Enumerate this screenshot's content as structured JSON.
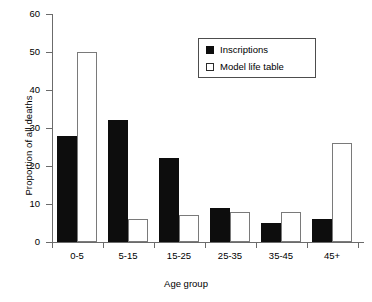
{
  "chart_data": {
    "type": "bar",
    "title": "",
    "xlabel": "Age group",
    "ylabel": "Proportion of all deaths",
    "categories": [
      "0-5",
      "5-15",
      "15-25",
      "25-35",
      "35-45",
      "45+"
    ],
    "series": [
      {
        "name": "Inscriptions",
        "values": [
          28,
          32,
          22,
          9,
          5,
          6
        ],
        "fill": "#0d0d0d",
        "style": "filled"
      },
      {
        "name": "Model life table",
        "values": [
          50,
          6,
          7,
          8,
          8,
          26
        ],
        "fill": "#ffffff",
        "style": "open"
      }
    ],
    "ylim": [
      0,
      60
    ],
    "yticks": [
      0,
      10,
      20,
      30,
      40,
      50,
      60
    ],
    "ytick_labels": [
      "0",
      "10",
      "20",
      "30",
      "40",
      "50",
      "60"
    ],
    "grid": false,
    "legend_position": "top-center-right",
    "legend_entries": [
      "Inscriptions",
      "Model life table"
    ]
  },
  "axis": {
    "y_label": "Proportion of all deaths",
    "x_label": "Age group"
  }
}
